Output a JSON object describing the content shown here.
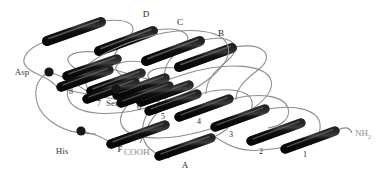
{
  "figure": {
    "background_color": "#ffffff",
    "element_colors": {
      "helix_fill": "#111111",
      "helix_highlight": "#6b6b6b",
      "strand_fill": "#141414",
      "loop_line": "#8e8e8e",
      "residue_marker": "#1a1a1a",
      "label_text": "#3a3a3a",
      "terminus_text": "#8a8a8a"
    },
    "termini": [
      {
        "id": "n-terminus",
        "label": "NH",
        "subscript": "2",
        "x": 345,
        "y": 133
      },
      {
        "id": "c-terminus",
        "label": "COOH",
        "subscript": "",
        "x": 124,
        "y": 152
      }
    ],
    "strand_labels": [
      {
        "id": "strand-1",
        "label": "1",
        "x": 305,
        "y": 155
      },
      {
        "id": "strand-2",
        "label": "2",
        "x": 261,
        "y": 152
      },
      {
        "id": "strand-3",
        "label": "3",
        "x": 231,
        "y": 135
      },
      {
        "id": "strand-4",
        "label": "4",
        "x": 199,
        "y": 122
      },
      {
        "id": "strand-5",
        "label": "5",
        "x": 163,
        "y": 117
      },
      {
        "id": "strand-6",
        "label": "6",
        "x": 139,
        "y": 108
      },
      {
        "id": "strand-7",
        "label": "7",
        "x": 99,
        "y": 104
      },
      {
        "id": "strand-8",
        "label": "8",
        "x": 71,
        "y": 92
      }
    ],
    "helix_labels": [
      {
        "id": "helix-a",
        "label": "A",
        "x": 185,
        "y": 166
      },
      {
        "id": "helix-b",
        "label": "B",
        "x": 221,
        "y": 36
      },
      {
        "id": "helix-c",
        "label": "C",
        "x": 180,
        "y": 25
      },
      {
        "id": "helix-d",
        "label": "D",
        "x": 146,
        "y": 16
      },
      {
        "id": "helix-f",
        "label": "F",
        "x": 120,
        "y": 150
      }
    ],
    "residue_labels": [
      {
        "id": "residue-asp",
        "label": "Asp",
        "x": 22,
        "y": 75,
        "marker_x": 49,
        "marker_y": 72
      },
      {
        "id": "residue-ser",
        "label": "Ser",
        "x": 112,
        "y": 106,
        "marker_x": 116,
        "marker_y": 89
      },
      {
        "id": "residue-his",
        "label": "His",
        "x": 62,
        "y": 154,
        "marker_x": 81,
        "marker_y": 131
      }
    ],
    "helices": [
      {
        "id": "helix-rod-d-top",
        "x1": 44,
        "y1": 42,
        "x2": 104,
        "y2": 21
      },
      {
        "id": "helix-rod-c-top",
        "x1": 96,
        "y1": 52,
        "x2": 156,
        "y2": 30
      },
      {
        "id": "helix-rod-b-top",
        "x1": 143,
        "y1": 62,
        "x2": 203,
        "y2": 40
      },
      {
        "id": "helix-rod-a-top",
        "x1": 176,
        "y1": 68,
        "x2": 235,
        "y2": 47
      },
      {
        "id": "helix-rod-mid-1",
        "x1": 64,
        "y1": 77,
        "x2": 120,
        "y2": 58
      },
      {
        "id": "helix-rod-mid-2",
        "x1": 88,
        "y1": 92,
        "x2": 144,
        "y2": 72
      },
      {
        "id": "helix-rod-mid-3",
        "x1": 114,
        "y1": 96,
        "x2": 168,
        "y2": 77
      },
      {
        "id": "helix-rod-mid-4",
        "x1": 138,
        "y1": 103,
        "x2": 192,
        "y2": 84
      },
      {
        "id": "helix-rod-f",
        "x1": 108,
        "y1": 145,
        "x2": 168,
        "y2": 124
      }
    ],
    "strands": [
      {
        "id": "strand-rod-8",
        "x1": 58,
        "y1": 88,
        "x2": 112,
        "y2": 69
      },
      {
        "id": "strand-rod-7",
        "x1": 84,
        "y1": 100,
        "x2": 138,
        "y2": 81
      },
      {
        "id": "strand-rod-6",
        "x1": 118,
        "y1": 104,
        "x2": 172,
        "y2": 85
      },
      {
        "id": "strand-rod-5",
        "x1": 146,
        "y1": 112,
        "x2": 200,
        "y2": 93
      },
      {
        "id": "strand-rod-4",
        "x1": 176,
        "y1": 118,
        "x2": 232,
        "y2": 98
      },
      {
        "id": "strand-rod-3",
        "x1": 212,
        "y1": 128,
        "x2": 268,
        "y2": 108
      },
      {
        "id": "strand-rod-2",
        "x1": 248,
        "y1": 142,
        "x2": 304,
        "y2": 122
      },
      {
        "id": "strand-rod-1",
        "x1": 282,
        "y1": 150,
        "x2": 338,
        "y2": 130
      },
      {
        "id": "strand-rod-a",
        "x1": 156,
        "y1": 157,
        "x2": 214,
        "y2": 137
      }
    ]
  }
}
